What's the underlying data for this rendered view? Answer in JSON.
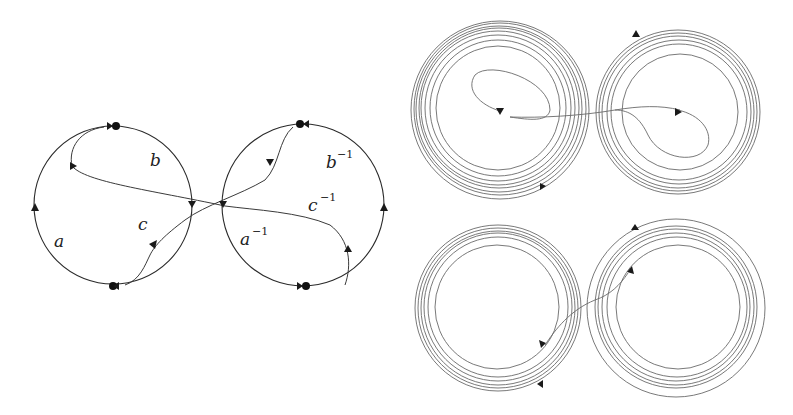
{
  "figure": {
    "left_panel": {
      "description": "Two circles joined at a crossing, with directed arcs labeled a, b, c and inverses",
      "labels": {
        "a": "a",
        "b": "b",
        "c": "c",
        "a_inv_base": "a",
        "b_inv_base": "b",
        "c_inv_base": "c",
        "inv_exp": "−1"
      },
      "circles": [
        {
          "cx": 113,
          "cy": 205,
          "r": 79
        },
        {
          "cx": 303,
          "cy": 205,
          "r": 81
        }
      ]
    },
    "right_panel": {
      "description": "Four spiral panels showing nested orbits with connecting trajectories",
      "spirals": [
        {
          "name": "top-left",
          "cx": 500,
          "cy": 110,
          "r_outer": 89,
          "r_inner": 62
        },
        {
          "name": "top-right",
          "cx": 678,
          "cy": 112,
          "r_outer": 82,
          "r_inner": 58
        },
        {
          "name": "bottom-left",
          "cx": 498,
          "cy": 308,
          "r_outer": 83,
          "r_inner": 62
        },
        {
          "name": "bottom-right",
          "cx": 676,
          "cy": 308,
          "r_outer": 89,
          "r_inner": 62
        }
      ]
    },
    "colors": {
      "line": "#2a2a2a",
      "spiral": "#6a6a6a",
      "background": "#ffffff"
    }
  }
}
